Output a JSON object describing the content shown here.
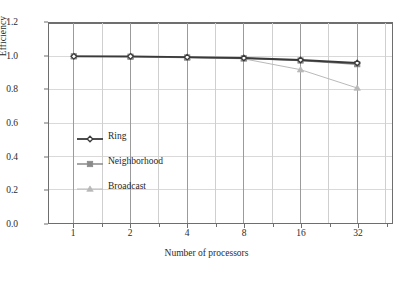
{
  "chart_data": {
    "type": "line",
    "title": "",
    "xlabel": "Number of processors",
    "ylabel": "Efficiency",
    "x": [
      1,
      2,
      4,
      8,
      16,
      32
    ],
    "categories": [
      "1",
      "2",
      "4",
      "8",
      "16",
      "32"
    ],
    "xtick_labels": [
      "1",
      "2",
      "4",
      "8",
      "16",
      "32"
    ],
    "ytick_labels": [
      "0.0",
      "0.2",
      "0.4",
      "0.6",
      "0.8",
      "1.0",
      "1.2"
    ],
    "ytick_values": [
      0.0,
      0.2,
      0.4,
      0.6,
      0.8,
      1.0,
      1.2
    ],
    "ylim": [
      0.0,
      1.2
    ],
    "grid": true,
    "grid_axis": "both",
    "legend_position": "inside-left-center",
    "legend_frame": false,
    "series": [
      {
        "name": "Ring",
        "values": [
          1.0,
          1.0,
          0.995,
          0.99,
          0.978,
          0.96
        ],
        "color": "#3a3a3a",
        "marker": "diamond",
        "line_width": 1.8
      },
      {
        "name": "Neighborhood",
        "values": [
          1.0,
          0.998,
          0.993,
          0.988,
          0.975,
          0.953
        ],
        "color": "#8a8a8a",
        "marker": "square",
        "line_width": 1.5
      },
      {
        "name": "Broadcast",
        "values": [
          1.0,
          0.998,
          0.992,
          0.985,
          0.92,
          0.81
        ],
        "color": "#b8b8b8",
        "marker": "triangle",
        "line_width": 1.0
      }
    ]
  }
}
